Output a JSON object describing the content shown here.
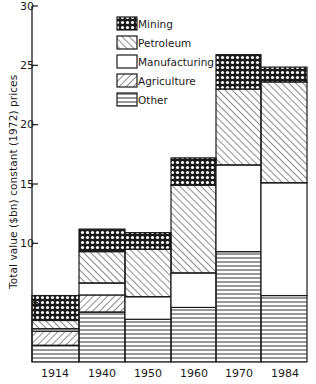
{
  "chart_data": {
    "type": "bar",
    "stacked": true,
    "title": "",
    "xlabel": "",
    "ylabel": "Total value ($bn) constant (1972) prices",
    "ylim": [
      0,
      30
    ],
    "yticks": [
      5,
      10,
      15,
      20,
      25,
      30
    ],
    "ytick_labels": [
      "5",
      "10",
      "15",
      "20",
      "25",
      "30"
    ],
    "categories": [
      "1914",
      "1940",
      "1950",
      "1960",
      "1970",
      "1984"
    ],
    "grid": false,
    "legend_position": "upper left (inside plot)",
    "series": [
      {
        "name": "Other",
        "pattern": "horizontal-lines",
        "values": [
          1.4,
          4.2,
          3.6,
          4.6,
          9.3,
          5.6
        ]
      },
      {
        "name": "Agriculture",
        "pattern": "forward-diagonal-hatch",
        "values": [
          1.2,
          1.45,
          0.0,
          0.0,
          0.0,
          0.0
        ]
      },
      {
        "name": "Manufacturing",
        "pattern": "blank",
        "values": [
          0.2,
          1.0,
          1.9,
          2.9,
          7.3,
          9.5
        ]
      },
      {
        "name": "Petroleum",
        "pattern": "back-diagonal-hatch",
        "values": [
          0.7,
          2.65,
          4.0,
          7.4,
          6.4,
          8.5
        ]
      },
      {
        "name": "Mining",
        "pattern": "cross-hatch",
        "values": [
          2.1,
          1.9,
          1.4,
          2.3,
          2.9,
          1.25
        ]
      }
    ],
    "totals": [
      5.6,
      11.2,
      10.9,
      17.2,
      25.9,
      24.85
    ]
  },
  "legend": {
    "items": [
      {
        "label": "Mining",
        "pattern": "cross"
      },
      {
        "label": "Petroleum",
        "pattern": "back"
      },
      {
        "label": "Manufacturing",
        "pattern": "blank"
      },
      {
        "label": "Agriculture",
        "pattern": "fwd"
      },
      {
        "label": "Other",
        "pattern": "horiz"
      }
    ]
  },
  "axis": {
    "ylabel": "Total value ($bn) constant (1972) prices",
    "ticks": [
      "5",
      "10",
      "15",
      "20",
      "25",
      "30"
    ],
    "xlabels": [
      "1914",
      "1940",
      "1950",
      "1960",
      "1970",
      "1984"
    ]
  },
  "colors": {
    "ink": "#1a1a1a",
    "background": "#ffffff"
  }
}
